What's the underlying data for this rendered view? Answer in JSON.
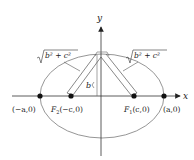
{
  "diagram": {
    "type": "ellipse-foci",
    "axes": {
      "x_label": "x",
      "y_label": "y"
    },
    "points": {
      "left_vertex": "(−a,0)",
      "right_vertex": "(a,0)",
      "focus_2": {
        "name": "F",
        "sub": "2",
        "coord": "(−c,0)"
      },
      "focus_1": {
        "name": "F",
        "sub": "1",
        "coord": "(c,0)"
      }
    },
    "labels": {
      "left_distance": "b² + c²",
      "right_distance": "b² + c²",
      "semi_minor": "b"
    },
    "colors": {
      "ellipse": "#8a8a8a",
      "axes": "#333333",
      "points": "#111111"
    }
  }
}
